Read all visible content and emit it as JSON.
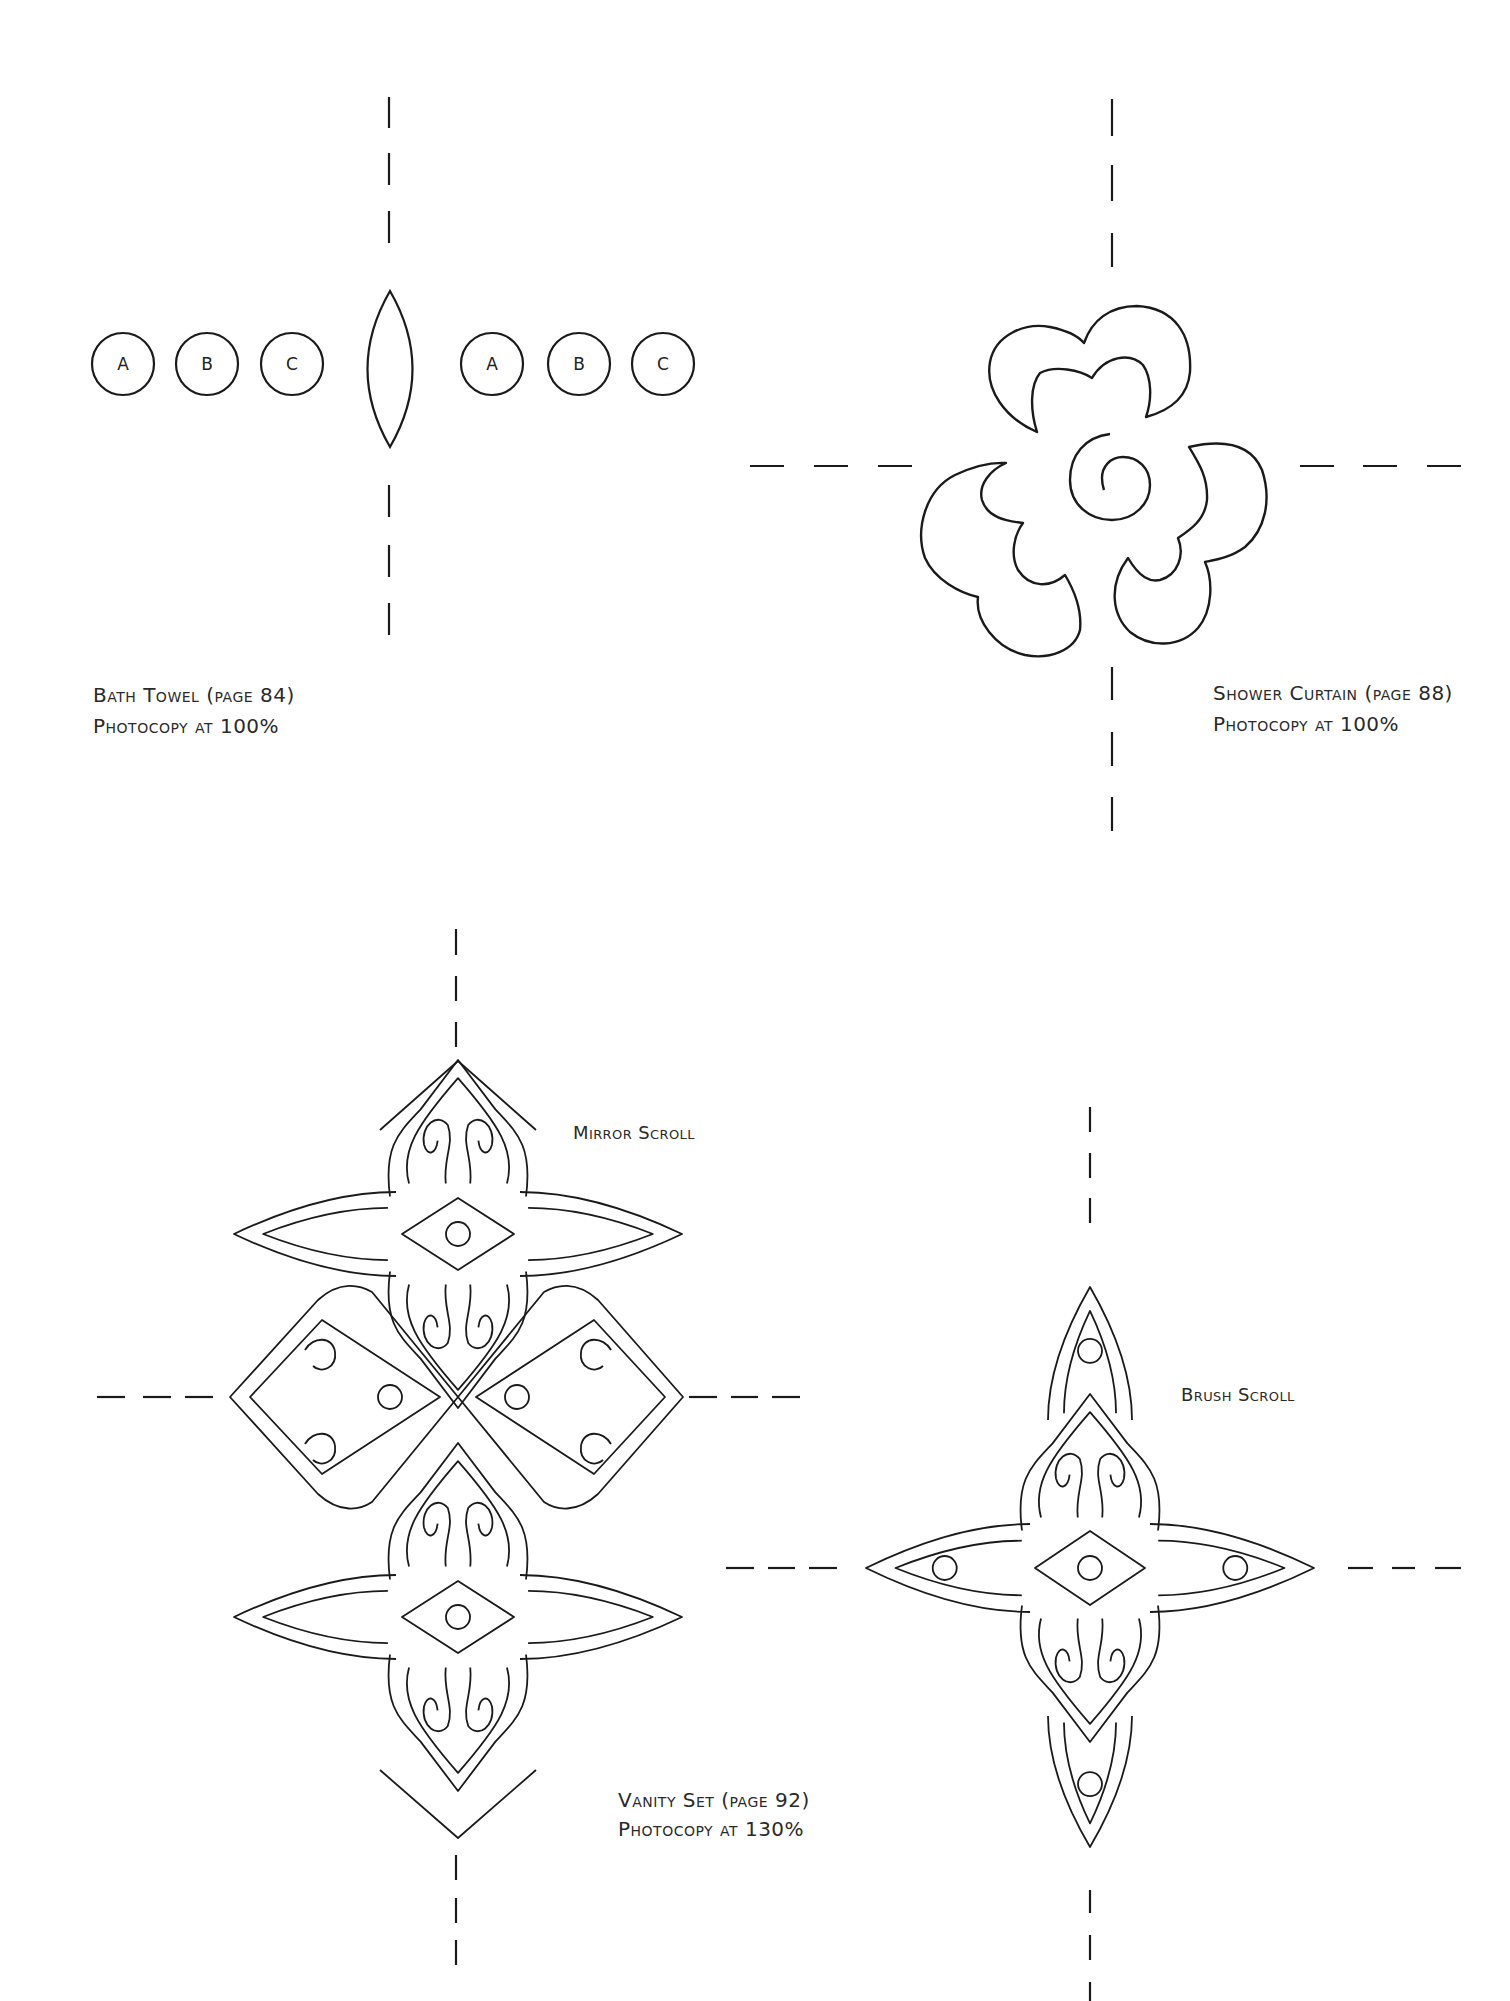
{
  "page": {
    "background": "#ffffff",
    "ink": "#1a1a1a"
  },
  "bath_towel": {
    "title": "Bath Towel (page 84)",
    "subtitle": "Photocopy at 100%",
    "circle_labels_left": [
      "A",
      "B",
      "C"
    ],
    "circle_labels_right": [
      "A",
      "B",
      "C"
    ]
  },
  "shower_curtain": {
    "title": "Shower Curtain (page 88)",
    "subtitle": "Photocopy at 100%"
  },
  "vanity_set": {
    "title": "Vanity Set (page 92)",
    "subtitle": "Photocopy at 130%",
    "mirror_label": "Mirror Scroll",
    "brush_label": "Brush Scroll"
  }
}
